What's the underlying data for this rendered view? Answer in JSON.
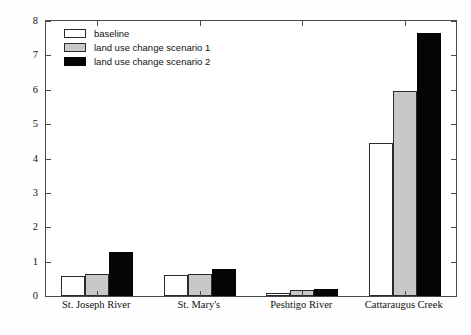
{
  "chart_data": {
    "type": "bar",
    "title": "",
    "xlabel": "",
    "ylabel": "Sediment yield (tons/ha/year)",
    "ylim": [
      0,
      8
    ],
    "yticks": [
      0,
      1,
      2,
      3,
      4,
      5,
      6,
      7,
      8
    ],
    "ytick_labels": [
      "0",
      "1",
      "2",
      "3",
      "4",
      "5",
      "6",
      "7",
      "8"
    ],
    "grid": false,
    "legend_position": "upper left",
    "categories": [
      "St. Joseph River",
      "St. Mary's",
      "Peshtigo River",
      "Cattaraugus Creek"
    ],
    "series": [
      {
        "name": "baseline",
        "color": "#ffffff",
        "edge_color": "#2a2a2a",
        "values": [
          0.57,
          0.6,
          0.1,
          4.45
        ]
      },
      {
        "name": "land use change scenario 1",
        "color": "#c8c8c8",
        "edge_color": "#2a2a2a",
        "values": [
          0.65,
          0.63,
          0.17,
          5.97
        ]
      },
      {
        "name": "land use change scenario 2",
        "color": "#050505",
        "edge_color": "#050505",
        "values": [
          1.28,
          0.78,
          0.2,
          7.66
        ]
      }
    ]
  },
  "legend": {
    "items": [
      {
        "label": "baseline"
      },
      {
        "label": "land use change scenario 1"
      },
      {
        "label": "land use change scenario 2"
      }
    ]
  }
}
